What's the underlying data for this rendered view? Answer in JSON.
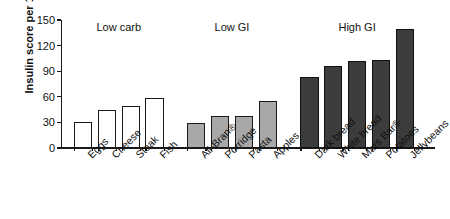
{
  "chart_data": {
    "type": "bar",
    "title": "",
    "xlabel": "",
    "ylabel": "Insulin score per 1000 kJ",
    "ylim": [
      0,
      150
    ],
    "yticks": [
      0,
      30,
      60,
      90,
      120,
      150
    ],
    "grid": false,
    "legend": "none",
    "group_labels": [
      "Low carb",
      "Low GI",
      "High GI"
    ],
    "categories": [
      "Eggs",
      "Cheese",
      "Steak",
      "Fish",
      "All-Bran®",
      "Porridge",
      "Pasta",
      "Apples",
      "Dark bread",
      "White bread",
      "Mars Bar®",
      "Potatoes",
      "Jellybeans"
    ],
    "values": [
      31,
      45,
      49,
      59,
      29,
      37,
      38,
      55,
      83,
      96,
      102,
      103,
      140
    ],
    "groups": [
      {
        "name": "Low carb",
        "fill": "#ffffff",
        "categories": [
          "Eggs",
          "Cheese",
          "Steak",
          "Fish"
        ],
        "values": [
          31,
          45,
          49,
          59
        ]
      },
      {
        "name": "Low GI",
        "fill": "#a8a8a8",
        "categories": [
          "All-Bran®",
          "Porridge",
          "Pasta",
          "Apples"
        ],
        "values": [
          29,
          37,
          38,
          55
        ]
      },
      {
        "name": "High GI",
        "fill": "#3c3c3c",
        "categories": [
          "Dark bread",
          "White bread",
          "Mars Bar®",
          "Potatoes",
          "Jellybeans"
        ],
        "values": [
          83,
          96,
          102,
          103,
          140
        ]
      }
    ],
    "colors": {
      "axis": "#1a1a1a",
      "low_carb": "#ffffff",
      "low_gi": "#a8a8a8",
      "high_gi": "#3c3c3c",
      "background": "#ffffff"
    }
  }
}
